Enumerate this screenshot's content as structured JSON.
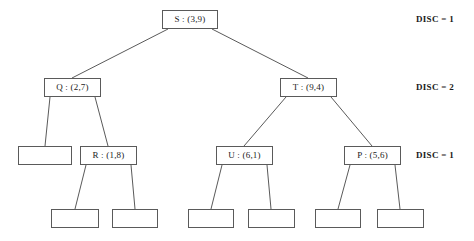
{
  "diagram": {
    "stroke_color": "#5a5a5a",
    "text_color": "#1a1a1a",
    "background_color": "#ffffff",
    "levels": [
      {
        "index": 0,
        "disc_label": "DISC = 1",
        "nodes": [
          {
            "id": "S",
            "label": "S : (3,9)",
            "key": "S",
            "point": "(3,9)",
            "empty": false,
            "x": 162,
            "y": 10,
            "w": 56,
            "h": 19
          }
        ]
      },
      {
        "index": 1,
        "disc_label": "DISC = 2",
        "nodes": [
          {
            "id": "Q",
            "label": "Q : (2,7)",
            "key": "Q",
            "point": "(2,7)",
            "empty": false,
            "x": 44,
            "y": 78,
            "w": 57,
            "h": 19
          },
          {
            "id": "T",
            "label": "T : (9,4)",
            "key": "T",
            "point": "(9,4)",
            "empty": false,
            "x": 280,
            "y": 78,
            "w": 57,
            "h": 19
          }
        ]
      },
      {
        "index": 2,
        "disc_label": "DISC = 1",
        "nodes": [
          {
            "id": "L1",
            "label": "",
            "key": "",
            "point": "",
            "empty": true,
            "x": 18,
            "y": 146,
            "w": 54,
            "h": 19
          },
          {
            "id": "R",
            "label": "R : (1,8)",
            "key": "R",
            "point": "(1,8)",
            "empty": false,
            "x": 80,
            "y": 146,
            "w": 57,
            "h": 19
          },
          {
            "id": "U",
            "label": "U : (6,1)",
            "key": "U",
            "point": "(6,1)",
            "empty": false,
            "x": 216,
            "y": 146,
            "w": 57,
            "h": 19
          },
          {
            "id": "P",
            "label": "P : (5,6)",
            "key": "P",
            "point": "(5,6)",
            "empty": false,
            "x": 344,
            "y": 146,
            "w": 57,
            "h": 19
          }
        ]
      },
      {
        "index": 3,
        "disc_label": "",
        "nodes": [
          {
            "id": "L2",
            "label": "",
            "key": "",
            "point": "",
            "empty": true,
            "x": 51,
            "y": 209,
            "w": 48,
            "h": 19
          },
          {
            "id": "L3",
            "label": "",
            "key": "",
            "point": "",
            "empty": true,
            "x": 112,
            "y": 209,
            "w": 46,
            "h": 19
          },
          {
            "id": "L4",
            "label": "",
            "key": "",
            "point": "",
            "empty": true,
            "x": 188,
            "y": 209,
            "w": 46,
            "h": 19
          },
          {
            "id": "L5",
            "label": "",
            "key": "",
            "point": "",
            "empty": true,
            "x": 248,
            "y": 209,
            "w": 47,
            "h": 19
          },
          {
            "id": "L6",
            "label": "",
            "key": "",
            "point": "",
            "empty": true,
            "x": 315,
            "y": 209,
            "w": 46,
            "h": 19
          },
          {
            "id": "L7",
            "label": "",
            "key": "",
            "point": "",
            "empty": true,
            "x": 377,
            "y": 209,
            "w": 47,
            "h": 19
          }
        ]
      }
    ],
    "edges": [
      {
        "from": "S",
        "to": "Q",
        "x1": 168,
        "y1": 29,
        "x2": 72,
        "y2": 78
      },
      {
        "from": "S",
        "to": "T",
        "x1": 212,
        "y1": 29,
        "x2": 308,
        "y2": 78
      },
      {
        "from": "Q",
        "to": "L1",
        "x1": 50,
        "y1": 97,
        "x2": 45,
        "y2": 146
      },
      {
        "from": "Q",
        "to": "R",
        "x1": 95,
        "y1": 97,
        "x2": 108,
        "y2": 146
      },
      {
        "from": "T",
        "to": "U",
        "x1": 286,
        "y1": 97,
        "x2": 244,
        "y2": 146
      },
      {
        "from": "T",
        "to": "P",
        "x1": 331,
        "y1": 97,
        "x2": 372,
        "y2": 146
      },
      {
        "from": "R",
        "to": "L2",
        "x1": 86,
        "y1": 165,
        "x2": 75,
        "y2": 209
      },
      {
        "from": "R",
        "to": "L3",
        "x1": 131,
        "y1": 165,
        "x2": 135,
        "y2": 209
      },
      {
        "from": "U",
        "to": "L4",
        "x1": 222,
        "y1": 165,
        "x2": 211,
        "y2": 209
      },
      {
        "from": "U",
        "to": "L5",
        "x1": 267,
        "y1": 165,
        "x2": 271,
        "y2": 209
      },
      {
        "from": "P",
        "to": "L6",
        "x1": 350,
        "y1": 165,
        "x2": 338,
        "y2": 209
      },
      {
        "from": "P",
        "to": "L7",
        "x1": 395,
        "y1": 165,
        "x2": 400,
        "y2": 209
      }
    ],
    "disc_labels": [
      {
        "text": "DISC = 1",
        "x": 416,
        "y": 14
      },
      {
        "text": "DISC = 2",
        "x": 416,
        "y": 82
      },
      {
        "text": "DISC = 1",
        "x": 416,
        "y": 150
      }
    ]
  }
}
